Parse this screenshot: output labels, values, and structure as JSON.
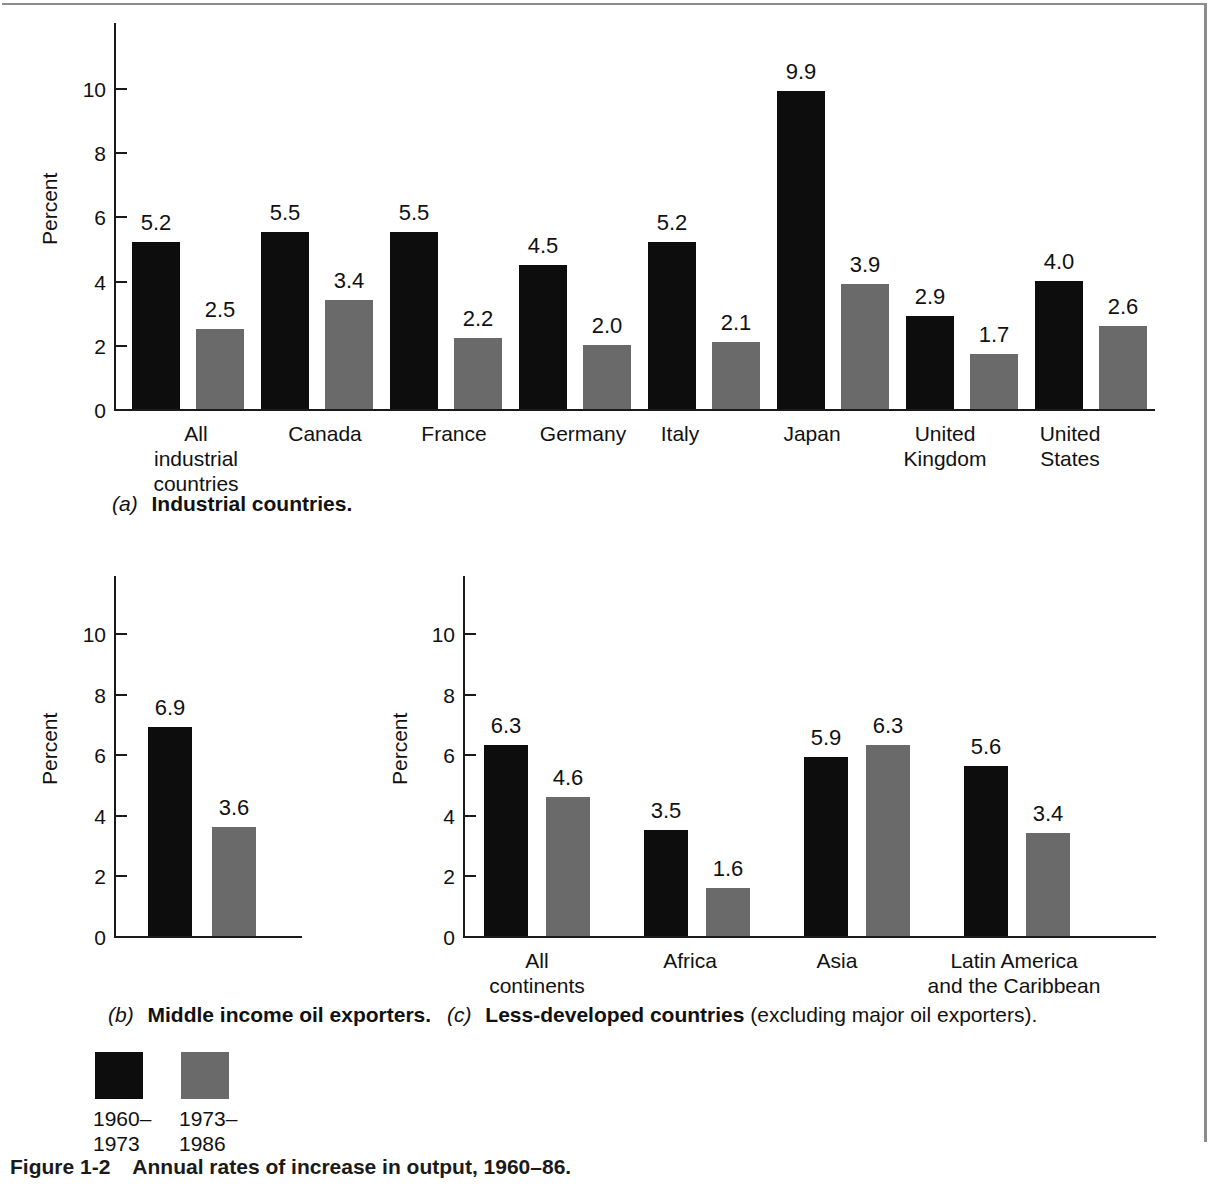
{
  "figure": {
    "number": "Figure 1-2",
    "caption": "Annual rates of increase in output, 1960–86."
  },
  "legend": {
    "series": [
      {
        "label_line1": "1960–",
        "label_line2": "1973",
        "color": "#0d0d0d",
        "name": "1960-1973"
      },
      {
        "label_line1": "1973–",
        "label_line2": "1986",
        "color": "#6a6a6a",
        "name": "1973-1986"
      }
    ]
  },
  "panels": {
    "a": {
      "tag": "(a)",
      "caption_bold": "Industrial countries.",
      "caption_rest": ""
    },
    "b": {
      "tag": "(b)",
      "caption_bold": "Middle income oil exporters.",
      "caption_rest": ""
    },
    "c": {
      "tag": "(c)",
      "caption_bold": "Less-developed countries",
      "caption_rest": " (excluding major oil exporters)."
    }
  },
  "axis": {
    "ylabel": "Percent",
    "ticks": [
      "0",
      "2",
      "4",
      "6",
      "8",
      "10"
    ]
  },
  "chart_data": [
    {
      "id": "a",
      "type": "bar",
      "title": "(a) Industrial countries.",
      "xlabel": "",
      "ylabel": "Percent",
      "ylim": [
        0,
        11.5
      ],
      "yticks": [
        0,
        2,
        4,
        6,
        8,
        10
      ],
      "grid": false,
      "legend_position": "below-figure",
      "categories": [
        "All industrial countries",
        "Canada",
        "France",
        "Germany",
        "Italy",
        "Japan",
        "United Kingdom",
        "United States"
      ],
      "category_lines": [
        [
          "All",
          "industrial",
          "countries"
        ],
        [
          "Canada"
        ],
        [
          "France"
        ],
        [
          "Germany"
        ],
        [
          "Italy"
        ],
        [
          "Japan"
        ],
        [
          "United",
          "Kingdom"
        ],
        [
          "United",
          "States"
        ]
      ],
      "series": [
        {
          "name": "1960–1973",
          "color": "#0d0d0d",
          "values": [
            5.2,
            5.5,
            5.5,
            4.5,
            5.2,
            9.9,
            2.9,
            4.0
          ]
        },
        {
          "name": "1973–1986",
          "color": "#6a6a6a",
          "values": [
            2.5,
            3.4,
            2.2,
            2.0,
            2.1,
            3.9,
            1.7,
            2.6
          ]
        }
      ],
      "labels": [
        [
          "5.2",
          "5.5",
          "5.5",
          "4.5",
          "5.2",
          "9.9",
          "2.9",
          "4.0"
        ],
        [
          "2.5",
          "3.4",
          "2.2",
          "2.0",
          "2.1",
          "3.9",
          "1.7",
          "2.6"
        ]
      ]
    },
    {
      "id": "b",
      "type": "bar",
      "title": "(b) Middle income oil exporters.",
      "xlabel": "",
      "ylabel": "Percent",
      "ylim": [
        0,
        11.5
      ],
      "yticks": [
        0,
        2,
        4,
        6,
        8,
        10
      ],
      "grid": false,
      "categories": [
        ""
      ],
      "category_lines": [
        []
      ],
      "series": [
        {
          "name": "1960–1973",
          "color": "#0d0d0d",
          "values": [
            6.9
          ]
        },
        {
          "name": "1973–1986",
          "color": "#6a6a6a",
          "values": [
            3.6
          ]
        }
      ],
      "labels": [
        [
          "6.9"
        ],
        [
          "3.6"
        ]
      ]
    },
    {
      "id": "c",
      "type": "bar",
      "title": "(c) Less-developed countries (excluding major oil exporters).",
      "xlabel": "",
      "ylabel": "Percent",
      "ylim": [
        0,
        11.5
      ],
      "yticks": [
        0,
        2,
        4,
        6,
        8,
        10
      ],
      "grid": false,
      "categories": [
        "All continents",
        "Africa",
        "Asia",
        "Latin America and the Caribbean"
      ],
      "category_lines": [
        [
          "All",
          "continents"
        ],
        [
          "Africa"
        ],
        [
          "Asia"
        ],
        [
          "Latin America",
          "and the Caribbean"
        ]
      ],
      "series": [
        {
          "name": "1960–1973",
          "color": "#0d0d0d",
          "values": [
            6.3,
            3.5,
            5.9,
            5.6
          ]
        },
        {
          "name": "1973–1986",
          "color": "#6a6a6a",
          "values": [
            4.6,
            1.6,
            6.3,
            3.4
          ]
        }
      ],
      "labels": [
        [
          "6.3",
          "3.5",
          "5.9",
          "5.6"
        ],
        [
          "4.6",
          "1.6",
          "6.3",
          "3.4"
        ]
      ]
    }
  ]
}
